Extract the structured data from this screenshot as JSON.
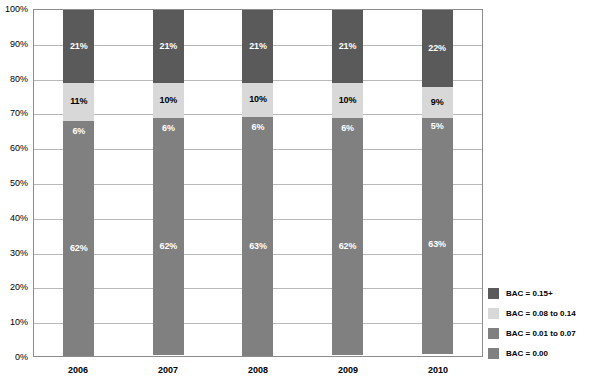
{
  "chart_data": {
    "type": "bar",
    "subtype": "stacked-bar-100-percent",
    "title": "",
    "xlabel": "",
    "ylabel": "",
    "categories": [
      "2006",
      "2007",
      "2008",
      "2009",
      "2010"
    ],
    "ylim": [
      0,
      100
    ],
    "ytick_labels": [
      "0%",
      "10%",
      "20%",
      "30%",
      "40%",
      "50%",
      "60%",
      "70%",
      "80%",
      "90%",
      "100%"
    ],
    "ytick_values": [
      0,
      10,
      20,
      30,
      40,
      50,
      60,
      70,
      80,
      90,
      100
    ],
    "grid": true,
    "grid_axis": "y",
    "legend_position": "right-bottom",
    "stack_order_bottom_to_top": [
      "BAC = 0.00",
      "BAC = 0.01 to 0.07",
      "BAC = 0.08 to 0.14",
      "BAC = 0.15+"
    ],
    "series": [
      {
        "name": "BAC = 0.15+",
        "color": "#5a5a5a",
        "label_color": "#ffffff",
        "values": [
          21,
          21,
          21,
          21,
          22
        ],
        "data_labels": [
          "21%",
          "21%",
          "21%",
          "21%",
          "22%"
        ]
      },
      {
        "name": "BAC = 0.08 to 0.14",
        "color": "#d8d8d8",
        "label_color": "#000000",
        "values": [
          11,
          10,
          10,
          10,
          9
        ],
        "data_labels": [
          "11%",
          "10%",
          "10%",
          "10%",
          "9%"
        ]
      },
      {
        "name": "BAC = 0.01 to 0.07",
        "color": "#808080",
        "label_color": "#ffffff",
        "values": [
          6,
          6,
          6,
          6,
          5
        ],
        "data_labels": [
          "6%",
          "6%",
          "6%",
          "6%",
          "5%"
        ]
      },
      {
        "name": "BAC = 0.00",
        "color": "#808080",
        "label_color": "#ffffff",
        "values": [
          62,
          62,
          63,
          62,
          63
        ],
        "data_labels": [
          "62%",
          "62%",
          "63%",
          "62%",
          "63%"
        ]
      }
    ]
  },
  "legend": {
    "items": [
      {
        "label": "BAC = 0.15+",
        "color": "#5a5a5a"
      },
      {
        "label": "BAC = 0.08 to 0.14",
        "color": "#d8d8d8"
      },
      {
        "label": "BAC = 0.01 to 0.07",
        "color": "#808080"
      },
      {
        "label": "BAC = 0.00",
        "color": "#808080"
      }
    ]
  },
  "colors": {
    "plot_border": "#8c8c8c",
    "gridline": "#b8b8b8",
    "background": "#ffffff",
    "text": "#000000"
  }
}
